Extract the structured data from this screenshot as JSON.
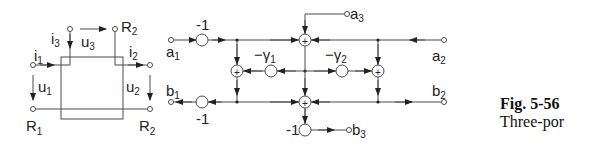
{
  "figure": {
    "number": "Fig. 5-56",
    "caption_text": "Three-por"
  },
  "circuit": {
    "labels": {
      "i1": "i",
      "i1_sub": "1",
      "i2": "i",
      "i2_sub": "2",
      "i3": "i",
      "i3_sub": "3",
      "u1": "u",
      "u1_sub": "1",
      "u2": "u",
      "u2_sub": "2",
      "u3": "u",
      "u3_sub": "3",
      "R1": "R",
      "R1_sub": "1",
      "R2_bottom": "R",
      "R2_bottom_sub": "2",
      "R2_top": "R",
      "R2_top_sub": "2"
    }
  },
  "signal_flow": {
    "ports": {
      "a1": "a",
      "a1_sub": "1",
      "a2": "a",
      "a2_sub": "2",
      "a3": "a",
      "a3_sub": "3",
      "b1": "b",
      "b1_sub": "1",
      "b2": "b",
      "b2_sub": "2",
      "b3": "b",
      "b3_sub": "3"
    },
    "gains": {
      "a1_gain": "-1",
      "b1_gain": "-1",
      "b3_gain": "-1",
      "gamma1": "−γ",
      "gamma1_sub": "1",
      "gamma2": "−γ",
      "gamma2_sub": "2"
    },
    "sum_symbol": "+"
  },
  "colors": {
    "line": "#4a4a4a",
    "text": "#222222",
    "background": "#ffffff"
  }
}
